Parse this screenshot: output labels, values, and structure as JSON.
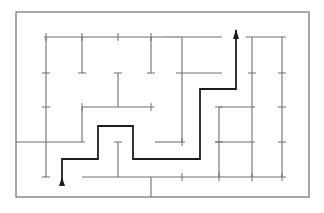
{
  "diagram": {
    "type": "maze",
    "colors": {
      "background": "#ffffff",
      "wall": "#6e6e6e",
      "path": "#1e1e1e"
    },
    "border": {
      "x1": 16,
      "y1": 12,
      "x2": 309,
      "y2": 197
    },
    "walls": [
      {
        "x1": 44,
        "y1": 37,
        "x2": 163,
        "y2": 37
      },
      {
        "x1": 163,
        "y1": 37,
        "x2": 181,
        "y2": 37
      },
      {
        "x1": 181,
        "y1": 37,
        "x2": 222,
        "y2": 37
      },
      {
        "x1": 246,
        "y1": 37,
        "x2": 286,
        "y2": 37
      },
      {
        "x1": 46,
        "y1": 37,
        "x2": 46,
        "y2": 177
      },
      {
        "x1": 82,
        "y1": 37,
        "x2": 82,
        "y2": 73
      },
      {
        "x1": 151,
        "y1": 37,
        "x2": 151,
        "y2": 73
      },
      {
        "x1": 182,
        "y1": 37,
        "x2": 182,
        "y2": 73
      },
      {
        "x1": 219,
        "y1": 73,
        "x2": 219,
        "y2": 73
      },
      {
        "x1": 252,
        "y1": 37,
        "x2": 252,
        "y2": 177
      },
      {
        "x1": 282,
        "y1": 37,
        "x2": 282,
        "y2": 177
      },
      {
        "x1": 176,
        "y1": 73,
        "x2": 222,
        "y2": 73
      },
      {
        "x1": 118,
        "y1": 73,
        "x2": 118,
        "y2": 107
      },
      {
        "x1": 82,
        "y1": 107,
        "x2": 154,
        "y2": 107
      },
      {
        "x1": 82,
        "y1": 107,
        "x2": 82,
        "y2": 142
      },
      {
        "x1": 151,
        "y1": 107,
        "x2": 151,
        "y2": 107
      },
      {
        "x1": 182,
        "y1": 73,
        "x2": 182,
        "y2": 142
      },
      {
        "x1": 16,
        "y1": 142,
        "x2": 85,
        "y2": 142
      },
      {
        "x1": 155,
        "y1": 142,
        "x2": 185,
        "y2": 142
      },
      {
        "x1": 219,
        "y1": 107,
        "x2": 255,
        "y2": 107
      },
      {
        "x1": 219,
        "y1": 107,
        "x2": 219,
        "y2": 177
      },
      {
        "x1": 215,
        "y1": 142,
        "x2": 255,
        "y2": 142
      },
      {
        "x1": 118,
        "y1": 142,
        "x2": 118,
        "y2": 177
      },
      {
        "x1": 82,
        "y1": 177,
        "x2": 286,
        "y2": 177
      },
      {
        "x1": 151,
        "y1": 177,
        "x2": 151,
        "y2": 197
      }
    ],
    "ticks": [
      {
        "x": 46,
        "y": 37,
        "orient": "v"
      },
      {
        "x": 82,
        "y": 37,
        "orient": "v"
      },
      {
        "x": 118,
        "y": 37,
        "orient": "v"
      },
      {
        "x": 151,
        "y": 37,
        "orient": "v"
      },
      {
        "x": 46,
        "y": 73,
        "orient": "h"
      },
      {
        "x": 82,
        "y": 73,
        "orient": "h"
      },
      {
        "x": 118,
        "y": 73,
        "orient": "h"
      },
      {
        "x": 151,
        "y": 73,
        "orient": "h"
      },
      {
        "x": 252,
        "y": 73,
        "orient": "h"
      },
      {
        "x": 282,
        "y": 73,
        "orient": "h"
      },
      {
        "x": 46,
        "y": 107,
        "orient": "h"
      },
      {
        "x": 82,
        "y": 107,
        "orient": "v"
      },
      {
        "x": 151,
        "y": 107,
        "orient": "v"
      },
      {
        "x": 219,
        "y": 107,
        "orient": "h"
      },
      {
        "x": 282,
        "y": 107,
        "orient": "h"
      },
      {
        "x": 118,
        "y": 142,
        "orient": "h"
      },
      {
        "x": 182,
        "y": 142,
        "orient": "v"
      },
      {
        "x": 219,
        "y": 142,
        "orient": "h"
      },
      {
        "x": 282,
        "y": 142,
        "orient": "h"
      },
      {
        "x": 46,
        "y": 177,
        "orient": "h"
      },
      {
        "x": 182,
        "y": 177,
        "orient": "v"
      },
      {
        "x": 219,
        "y": 177,
        "orient": "v"
      },
      {
        "x": 252,
        "y": 177,
        "orient": "v"
      },
      {
        "x": 282,
        "y": 177,
        "orient": "v"
      }
    ],
    "solution_path": {
      "points": [
        [
          62,
          185
        ],
        [
          62,
          159
        ],
        [
          98,
          159
        ],
        [
          98,
          126
        ],
        [
          133,
          126
        ],
        [
          133,
          159
        ],
        [
          200,
          159
        ],
        [
          200,
          89
        ],
        [
          236,
          89
        ],
        [
          236,
          30
        ]
      ],
      "start_label": "entrance",
      "end_label": "exit"
    }
  }
}
